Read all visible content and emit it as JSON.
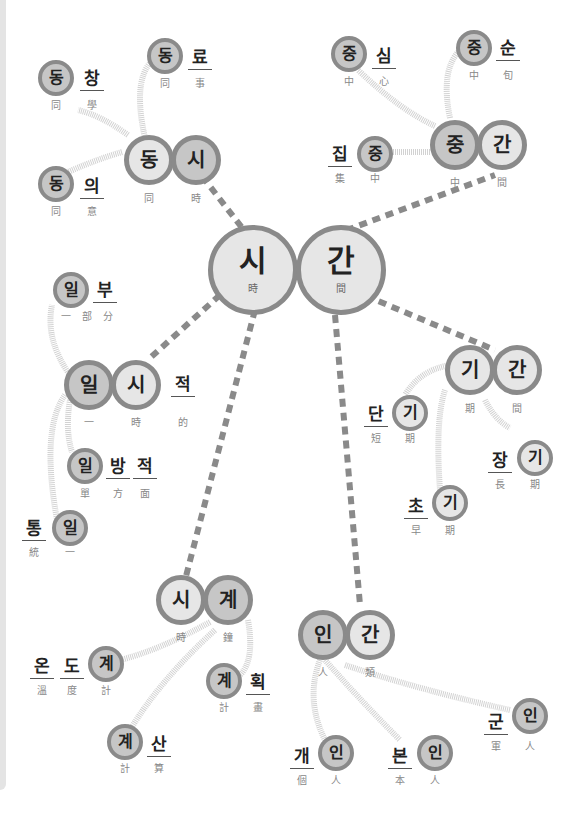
{
  "center": {
    "a": {
      "ko": "시",
      "hj": "時"
    },
    "b": {
      "ko": "간",
      "hj": "間"
    }
  },
  "hubs": {
    "dongsi": {
      "a": {
        "ko": "동",
        "hj": "同"
      },
      "b": {
        "ko": "시",
        "hj": "時"
      }
    },
    "junggan": {
      "a": {
        "ko": "중",
        "hj": "中"
      },
      "b": {
        "ko": "간",
        "hj": "間"
      }
    },
    "ilsi": {
      "a": {
        "ko": "일",
        "hj": "一"
      },
      "b": {
        "ko": "시",
        "hj": "時"
      },
      "suffix": {
        "ko": "적",
        "hj": "的"
      }
    },
    "gigan": {
      "a": {
        "ko": "기",
        "hj": "期"
      },
      "b": {
        "ko": "간",
        "hj": "間"
      }
    },
    "sigye": {
      "a": {
        "ko": "시",
        "hj": "時"
      },
      "b": {
        "ko": "계",
        "hj": "鐘"
      }
    },
    "ingan": {
      "a": {
        "ko": "인",
        "hj": "人"
      },
      "b": {
        "ko": "간",
        "hj": "類"
      }
    }
  },
  "words": {
    "dongchang": [
      {
        "ko": "동",
        "hj": "同"
      },
      {
        "ko": "창",
        "hj": "學"
      }
    ],
    "dongryo": [
      {
        "ko": "동",
        "hj": "同"
      },
      {
        "ko": "료",
        "hj": "事"
      }
    ],
    "dongui": [
      {
        "ko": "동",
        "hj": "同"
      },
      {
        "ko": "의",
        "hj": "意"
      }
    ],
    "jungsim": [
      {
        "ko": "중",
        "hj": "中"
      },
      {
        "ko": "심",
        "hj": "心"
      }
    ],
    "jungsun": [
      {
        "ko": "중",
        "hj": "中"
      },
      {
        "ko": "순",
        "hj": "旬"
      }
    ],
    "jipjung": [
      {
        "ko": "집",
        "hj": "集"
      },
      {
        "ko": "중",
        "hj": "中"
      }
    ],
    "ilbubun": [
      {
        "ko": "일",
        "hj": "一"
      },
      {
        "ko": "부",
        "hj": "部"
      },
      {
        "hj": "分"
      }
    ],
    "ilbangjeok": [
      {
        "ko": "일",
        "hj": "單"
      },
      {
        "ko": "방",
        "hj": "方"
      },
      {
        "ko": "적",
        "hj": "面"
      }
    ],
    "tongil": [
      {
        "ko": "통",
        "hj": "統"
      },
      {
        "ko": "일",
        "hj": "一"
      }
    ],
    "dangi": [
      {
        "ko": "단",
        "hj": "短"
      },
      {
        "ko": "기",
        "hj": "期"
      }
    ],
    "janggi": [
      {
        "ko": "장",
        "hj": "長"
      },
      {
        "ko": "기",
        "hj": "期"
      }
    ],
    "chogi": [
      {
        "ko": "초",
        "hj": "早"
      },
      {
        "ko": "기",
        "hj": "期"
      }
    ],
    "ondogye": [
      {
        "ko": "온",
        "hj": "溫"
      },
      {
        "ko": "도",
        "hj": "度"
      },
      {
        "ko": "계",
        "hj": "計"
      }
    ],
    "gyehoek": [
      {
        "ko": "계",
        "hj": "計"
      },
      {
        "ko": "획",
        "hj": "畫"
      }
    ],
    "gyesan": [
      {
        "ko": "계",
        "hj": "計"
      },
      {
        "ko": "산",
        "hj": "算"
      }
    ],
    "gaein": [
      {
        "ko": "개",
        "hj": "個"
      },
      {
        "ko": "인",
        "hj": "人"
      }
    ],
    "bonin": [
      {
        "ko": "본",
        "hj": "本"
      },
      {
        "ko": "인",
        "hj": "人"
      }
    ],
    "gunin": [
      {
        "ko": "군",
        "hj": "軍"
      },
      {
        "ko": "인",
        "hj": "人"
      }
    ]
  },
  "colors": {
    "ring": "#8a8a8a",
    "fill_light": "#e6e6e6",
    "fill_dark": "#c6c6c6",
    "link": "#8a8a8a"
  }
}
